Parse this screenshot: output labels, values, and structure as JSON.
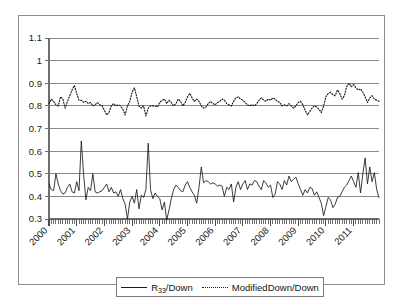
{
  "figure": {
    "background_color": "#ffffff",
    "frame_color": "#8d8d8d",
    "plot_border_color": "#6e6e6e",
    "gridline_color": "#8a8a8a",
    "series_color": "#1a1a1a"
  },
  "legend": {
    "position": "bottom-center",
    "entries": [
      {
        "label_prefix": "R",
        "label_sub": "33",
        "label_suffix": "/Down",
        "full_label": "R33/Down",
        "style": "solid"
      },
      {
        "label_prefix": "ModifiedDown/Down",
        "label_sub": "",
        "label_suffix": "",
        "full_label": "ModifiedDown/Down",
        "style": "dotted"
      }
    ]
  },
  "chart_data": {
    "type": "line",
    "title": "",
    "xlabel": "",
    "ylabel": "",
    "ylim": [
      0.3,
      1.1
    ],
    "ytick_labels": [
      "0.3",
      "0.4",
      "0.5",
      "0.6",
      "0.7",
      "0.8",
      "0.9",
      "1",
      "1.1"
    ],
    "ytick_values": [
      0.3,
      0.4,
      0.5,
      0.6,
      0.7,
      0.8,
      0.9,
      1.0,
      1.1
    ],
    "grid": true,
    "grid_axis": "y",
    "xtick_labels": [
      "2000",
      "2001",
      "2002",
      "2003",
      "2004",
      "2005",
      "2006",
      "2007",
      "2008",
      "2009",
      "2010",
      "2011"
    ],
    "xtick_rotation": -45,
    "x_minor_ticks": "monthly",
    "x_start": "2000-01",
    "x_end": "2011-12",
    "n_points": 144,
    "legend_position": "bottom-center",
    "series": [
      {
        "name": "R33/Down",
        "style": "solid",
        "values": [
          0.455,
          0.43,
          0.425,
          0.5,
          0.455,
          0.425,
          0.41,
          0.415,
          0.44,
          0.455,
          0.42,
          0.415,
          0.465,
          0.425,
          0.645,
          0.495,
          0.385,
          0.44,
          0.425,
          0.5,
          0.42,
          0.415,
          0.42,
          0.425,
          0.44,
          0.455,
          0.42,
          0.44,
          0.415,
          0.42,
          0.4,
          0.43,
          0.39,
          0.365,
          0.3,
          0.375,
          0.4,
          0.37,
          0.43,
          0.345,
          0.405,
          0.395,
          0.43,
          0.635,
          0.43,
          0.39,
          0.415,
          0.4,
          0.39,
          0.34,
          0.375,
          0.295,
          0.34,
          0.39,
          0.43,
          0.45,
          0.44,
          0.425,
          0.42,
          0.45,
          0.465,
          0.44,
          0.42,
          0.405,
          0.37,
          0.44,
          0.53,
          0.46,
          0.47,
          0.465,
          0.455,
          0.46,
          0.455,
          0.445,
          0.45,
          0.445,
          0.4,
          0.44,
          0.43,
          0.455,
          0.375,
          0.44,
          0.465,
          0.43,
          0.455,
          0.47,
          0.43,
          0.455,
          0.45,
          0.47,
          0.465,
          0.445,
          0.43,
          0.47,
          0.46,
          0.44,
          0.45,
          0.395,
          0.41,
          0.465,
          0.455,
          0.43,
          0.47,
          0.45,
          0.49,
          0.465,
          0.475,
          0.485,
          0.455,
          0.43,
          0.405,
          0.43,
          0.415,
          0.44,
          0.435,
          0.405,
          0.42,
          0.395,
          0.37,
          0.315,
          0.355,
          0.395,
          0.385,
          0.35,
          0.365,
          0.395,
          0.4,
          0.42,
          0.44,
          0.45,
          0.47,
          0.49,
          0.465,
          0.44,
          0.505,
          0.415,
          0.5,
          0.57,
          0.455,
          0.53,
          0.465,
          0.505,
          0.43,
          0.395
        ]
      },
      {
        "name": "ModifiedDown/Down",
        "style": "dotted",
        "values": [
          0.81,
          0.83,
          0.82,
          0.805,
          0.8,
          0.84,
          0.83,
          0.79,
          0.82,
          0.845,
          0.87,
          0.89,
          0.855,
          0.825,
          0.825,
          0.815,
          0.82,
          0.81,
          0.815,
          0.8,
          0.805,
          0.815,
          0.805,
          0.8,
          0.78,
          0.76,
          0.77,
          0.8,
          0.81,
          0.8,
          0.805,
          0.8,
          0.785,
          0.76,
          0.8,
          0.82,
          0.86,
          0.88,
          0.84,
          0.8,
          0.79,
          0.8,
          0.755,
          0.79,
          0.8,
          0.8,
          0.8,
          0.795,
          0.815,
          0.825,
          0.83,
          0.81,
          0.825,
          0.815,
          0.8,
          0.81,
          0.83,
          0.82,
          0.8,
          0.815,
          0.84,
          0.855,
          0.835,
          0.82,
          0.83,
          0.82,
          0.8,
          0.79,
          0.795,
          0.81,
          0.82,
          0.81,
          0.805,
          0.815,
          0.82,
          0.83,
          0.825,
          0.81,
          0.805,
          0.8,
          0.82,
          0.835,
          0.84,
          0.83,
          0.825,
          0.815,
          0.805,
          0.8,
          0.805,
          0.8,
          0.81,
          0.825,
          0.835,
          0.825,
          0.82,
          0.83,
          0.825,
          0.835,
          0.83,
          0.82,
          0.815,
          0.8,
          0.805,
          0.8,
          0.81,
          0.8,
          0.79,
          0.8,
          0.815,
          0.82,
          0.805,
          0.78,
          0.76,
          0.775,
          0.79,
          0.8,
          0.795,
          0.785,
          0.77,
          0.8,
          0.84,
          0.855,
          0.86,
          0.85,
          0.845,
          0.87,
          0.855,
          0.83,
          0.845,
          0.885,
          0.9,
          0.885,
          0.895,
          0.88,
          0.87,
          0.875,
          0.86,
          0.84,
          0.815,
          0.835,
          0.845,
          0.83,
          0.825,
          0.82
        ]
      }
    ]
  }
}
